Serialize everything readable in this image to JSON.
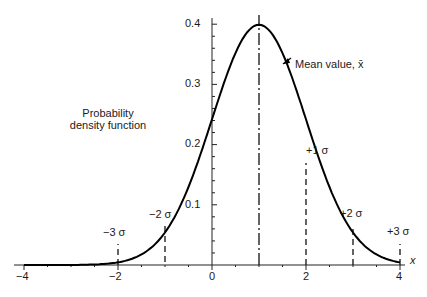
{
  "chart_data": {
    "type": "line",
    "title": "",
    "xlabel": "x",
    "ylabel": "Probability density function",
    "xlim": [
      -4,
      4.2
    ],
    "ylim": [
      0,
      0.41
    ],
    "x_ticks": [
      "-4",
      "-2",
      "0",
      "2",
      "4"
    ],
    "y_ticks": [
      "0.1",
      "0.2",
      "0.3",
      "0.4"
    ],
    "grid": false,
    "series": [
      {
        "name": "Normal PDF (mean 1, sigma 1)",
        "mean": 1,
        "sigma": 1,
        "x": [
          -4,
          -3,
          -2,
          -1,
          0,
          0.5,
          1,
          1.5,
          2,
          3,
          4
        ],
        "values": [
          1.5e-06,
          0.00013,
          0.0044,
          0.054,
          0.242,
          0.352,
          0.399,
          0.352,
          0.242,
          0.054,
          0.0044
        ]
      }
    ],
    "annotations": [
      {
        "text": "Mean value, x̄",
        "x": 1,
        "type": "dash-dot line"
      },
      {
        "text": "+1 σ",
        "x": 2
      },
      {
        "text": "+2 σ",
        "x": 3
      },
      {
        "text": "+3 σ",
        "x": 4
      },
      {
        "text": "−2 σ",
        "x": -1
      },
      {
        "text": "−3 σ",
        "x": -2
      }
    ]
  },
  "labels": {
    "ylabel_line1": "Probability",
    "ylabel_line2": "density function",
    "xlabel": "x",
    "mean": "Mean value, x̄",
    "p1": "+1 σ",
    "p2": "+2 σ",
    "p3": "+3 σ",
    "m2": "−2 σ",
    "m3": "−3 σ"
  },
  "ticks": {
    "x": [
      "−4",
      "−2",
      "0",
      "2",
      "4"
    ],
    "y": [
      "0.1",
      "0.2",
      "0.3",
      "0.4"
    ]
  }
}
